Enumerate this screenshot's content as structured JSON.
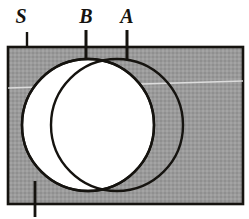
{
  "figure": {
    "name": "venn-diagram-two-sets-in-universal-set",
    "type": "set-diagram",
    "labels": {
      "universal_set": "S",
      "left_circle": "B",
      "right_circle": "A"
    },
    "colors": {
      "universe_fill": "#9a9a9a",
      "circle_fill": "#ffffff",
      "stroke": "#15130f",
      "page_background": "#ffffff",
      "scanline": "#e8e8e8"
    },
    "geometry": {
      "universe_rect": {
        "x": 8,
        "y": 47,
        "width": 235,
        "height": 157
      },
      "left_circle": {
        "cx": 88,
        "cy": 125,
        "r": 66
      },
      "right_circle": {
        "cx": 117,
        "cy": 125,
        "r": 66
      },
      "leaders": [
        {
          "name": "leader-s",
          "x": 27,
          "y1": 32,
          "y2": 48
        },
        {
          "name": "leader-b",
          "x": 86,
          "y1": 30,
          "y2": 60
        },
        {
          "name": "leader-a",
          "x": 127,
          "y1": 30,
          "y2": 60
        },
        {
          "name": "leader-bottom",
          "x": 35,
          "y1": 181,
          "y2": 217
        }
      ],
      "label_positions": [
        {
          "name": "label-s",
          "x": 21,
          "y": 23
        },
        {
          "name": "label-b",
          "x": 79,
          "y": 23
        },
        {
          "name": "label-a",
          "x": 121,
          "y": 23
        }
      ]
    }
  }
}
